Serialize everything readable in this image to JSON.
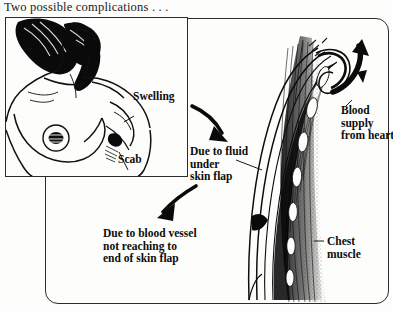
{
  "title": "Two possible complications . . .",
  "figure": {
    "type": "medical-illustration",
    "panels": [
      {
        "name": "inset-torso-panel",
        "description": "line drawing of a woman's head, shoulder, chest and breast showing post-operative site"
      },
      {
        "name": "flap-cross-section-panel",
        "description": "cross-section of skin flap over chest muscle with blood vessels"
      }
    ]
  },
  "labels": {
    "swelling": "Swelling",
    "scab": "Scab",
    "due_to_fluid": "Due to fluid\nunder\nskin flap",
    "due_to_blood_vessel": "Due to blood vessel\nnot reaching to\nend of skin flap",
    "blood_supply": "Blood\nsupply\nfrom heart",
    "chest_muscle": "Chest\nmuscle"
  },
  "colors": {
    "ink": "#111111",
    "frame": "#2b2b2b",
    "paper": "#fdfdfb"
  }
}
